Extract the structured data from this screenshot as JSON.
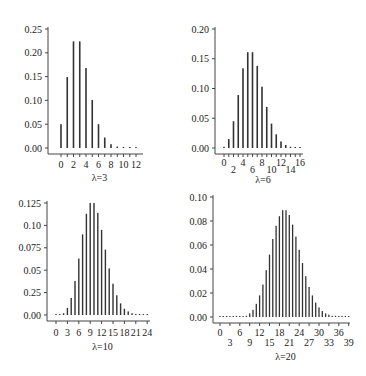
{
  "figure": {
    "bar_color": "#333333",
    "axis_color": "#444444"
  },
  "chart_data": [
    {
      "type": "bar",
      "title": "",
      "xlabel": "λ=3",
      "ylabel": "",
      "lambda": 3,
      "x": [
        0,
        1,
        2,
        3,
        4,
        5,
        6,
        7,
        8,
        9,
        10,
        11,
        12
      ],
      "values": [
        0.05,
        0.149,
        0.224,
        0.224,
        0.168,
        0.101,
        0.05,
        0.022,
        0.008,
        0.003,
        0.001,
        0.0,
        0.0
      ],
      "xticks": [
        0,
        1,
        2,
        3,
        4,
        5,
        6,
        7,
        8,
        9,
        10,
        11,
        12
      ],
      "xtick_labels": [
        "0",
        "2",
        "4",
        "6",
        "8",
        "10",
        "12"
      ],
      "xtick_label_positions": [
        0,
        2,
        4,
        6,
        8,
        10,
        12
      ],
      "ylim": [
        0,
        0.25
      ],
      "yticks": [
        0.0,
        0.05,
        0.1,
        0.15,
        0.2,
        0.25
      ],
      "ytick_labels": [
        "0.00",
        "0.05",
        "0.10",
        "0.15",
        "0.20",
        "0.25"
      ],
      "grid": false
    },
    {
      "type": "bar",
      "title": "",
      "xlabel": "λ=6",
      "ylabel": "",
      "lambda": 6,
      "x": [
        0,
        1,
        2,
        3,
        4,
        5,
        6,
        7,
        8,
        9,
        10,
        11,
        12,
        13,
        14,
        15,
        16
      ],
      "values": [
        0.002,
        0.015,
        0.045,
        0.089,
        0.134,
        0.161,
        0.161,
        0.138,
        0.103,
        0.069,
        0.041,
        0.023,
        0.011,
        0.005,
        0.002,
        0.001,
        0.0
      ],
      "xticks": [
        0,
        1,
        2,
        3,
        4,
        5,
        6,
        7,
        8,
        9,
        10,
        11,
        12,
        13,
        14,
        15,
        16
      ],
      "xtick_labels": [
        "0",
        "2",
        "4",
        "6",
        "8",
        "10",
        "12",
        "14",
        "16"
      ],
      "xtick_label_positions": [
        0,
        2,
        4,
        6,
        8,
        10,
        12,
        14,
        16
      ],
      "ylim": [
        0,
        0.2
      ],
      "yticks": [
        0.0,
        0.05,
        0.1,
        0.15,
        0.2
      ],
      "ytick_labels": [
        "0.00",
        "0.05",
        "0.10",
        "0.15",
        "0.20"
      ],
      "grid": false
    },
    {
      "type": "bar",
      "title": "",
      "xlabel": "λ=10",
      "ylabel": "",
      "lambda": 10,
      "x": [
        0,
        1,
        2,
        3,
        4,
        5,
        6,
        7,
        8,
        9,
        10,
        11,
        12,
        13,
        14,
        15,
        16,
        17,
        18,
        19,
        20,
        21,
        22,
        23,
        24
      ],
      "values": [
        0.0,
        0.0,
        0.002,
        0.008,
        0.019,
        0.038,
        0.063,
        0.09,
        0.113,
        0.125,
        0.125,
        0.114,
        0.095,
        0.073,
        0.052,
        0.035,
        0.022,
        0.013,
        0.007,
        0.004,
        0.002,
        0.001,
        0.0,
        0.0,
        0.0
      ],
      "xticks": [
        0,
        3,
        6,
        9,
        12,
        15,
        18,
        21,
        24
      ],
      "xtick_labels": [
        "0",
        "3",
        "6",
        "9",
        "12",
        "15",
        "18",
        "21",
        "24"
      ],
      "xtick_label_positions": [
        0,
        3,
        6,
        9,
        12,
        15,
        18,
        21,
        24
      ],
      "ylim": [
        0,
        0.125
      ],
      "yticks": [
        0.0,
        0.025,
        0.05,
        0.075,
        0.1,
        0.125
      ],
      "ytick_labels": [
        "0.00",
        "0.25",
        "0.05",
        "0.075",
        "0.10",
        "0.125"
      ],
      "grid": false
    },
    {
      "type": "bar",
      "title": "",
      "xlabel": "λ=20",
      "ylabel": "",
      "lambda": 20,
      "x": [
        0,
        1,
        2,
        3,
        4,
        5,
        6,
        7,
        8,
        9,
        10,
        11,
        12,
        13,
        14,
        15,
        16,
        17,
        18,
        19,
        20,
        21,
        22,
        23,
        24,
        25,
        26,
        27,
        28,
        29,
        30,
        31,
        32,
        33,
        34,
        35,
        36,
        37,
        38,
        39
      ],
      "values": [
        0,
        0,
        0,
        0,
        0,
        0,
        0.0,
        0.0,
        0.001,
        0.003,
        0.006,
        0.011,
        0.018,
        0.027,
        0.039,
        0.052,
        0.065,
        0.076,
        0.084,
        0.089,
        0.089,
        0.085,
        0.077,
        0.067,
        0.056,
        0.045,
        0.034,
        0.025,
        0.018,
        0.012,
        0.008,
        0.005,
        0.003,
        0.002,
        0.001,
        0.001,
        0.0,
        0.0,
        0.0,
        0.0
      ],
      "xticks": [
        0,
        3,
        6,
        9,
        12,
        15,
        18,
        21,
        24,
        27,
        30,
        33,
        36,
        39
      ],
      "xtick_labels_upper": [
        "0",
        "6",
        "12",
        "18",
        "24",
        "30",
        "36"
      ],
      "xtick_labels_upper_positions": [
        0,
        6,
        12,
        18,
        24,
        30,
        36
      ],
      "xtick_labels_lower": [
        "3",
        "9",
        "15",
        "21",
        "27",
        "33",
        "39"
      ],
      "xtick_labels_lower_positions": [
        3,
        9,
        15,
        21,
        27,
        33,
        39
      ],
      "ylim": [
        0,
        0.1
      ],
      "yticks": [
        0.0,
        0.02,
        0.04,
        0.06,
        0.08,
        0.1
      ],
      "ytick_labels": [
        "0.00",
        "0.02",
        "0.04",
        "0.06",
        "0.08",
        "0.10"
      ],
      "grid": false
    }
  ]
}
